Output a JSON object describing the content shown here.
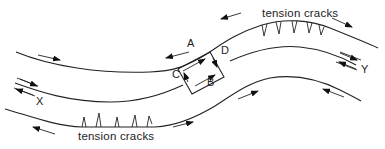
{
  "diagram": {
    "type": "fault-zone schematic (curved strike-slip fault with shear sense)",
    "labels": {
      "top_caption": "tension cracks",
      "bottom_caption": "tension cracks",
      "point_a": "A",
      "point_b": "B",
      "point_c": "C",
      "point_d": "D",
      "point_x": "X",
      "point_y": "Y"
    },
    "elements": [
      {
        "id": "upper-block-boundary",
        "desc": "upper curved line with tension cracks near crest"
      },
      {
        "id": "fault-trace",
        "desc": "central curved fault line between X and Y, with shear box ABCD at bend"
      },
      {
        "id": "lower-block-boundary",
        "desc": "lower curved line with tension cracks near trough"
      },
      {
        "id": "shear-box",
        "desc": "rectangle with corners labelled A, B, C, D and internal shear arrows"
      }
    ],
    "colors": {
      "line": "#222222",
      "background": "#ffffff"
    }
  }
}
